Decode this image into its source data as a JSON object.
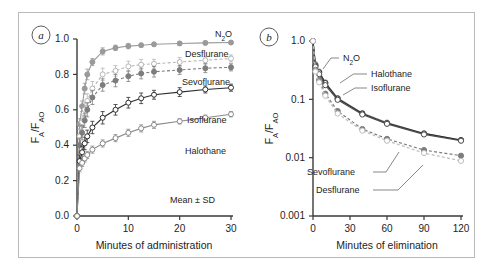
{
  "figure": {
    "background_color": "#ffffff",
    "frame_color": "#b9b9b9",
    "axis_color": "#3a3a3a"
  },
  "panels": [
    {
      "tag": "a",
      "xlabel": "Minutes of administration",
      "ylabel_main": "F",
      "ylabel_sub1": "A",
      "ylabel_slash": "/F",
      "ylabel_sub2": "AO",
      "annotation": "Mean ± SD",
      "xticks": [
        "0",
        "10",
        "20",
        "30"
      ],
      "yticks": [
        "0.0",
        "0.2",
        "0.4",
        "0.6",
        "0.8",
        "1.0"
      ],
      "series_labels": [
        "N2O",
        "Desflurane",
        "Sevoflurane",
        "Isoflurane",
        "Halothane"
      ]
    },
    {
      "tag": "b",
      "xlabel": "Minutes of elimination",
      "ylabel_main": "F",
      "ylabel_sub1": "A",
      "ylabel_slash": "/F",
      "ylabel_sub2": "AO",
      "xticks": [
        "0",
        "30",
        "60",
        "90",
        "120"
      ],
      "yticks": [
        "0.001",
        "0.01",
        "0.1",
        "1.0"
      ],
      "series_labels": [
        "N2O",
        "Halothane",
        "Isoflurane",
        "Sevoflurane",
        "Desflurane"
      ]
    }
  ],
  "chart_data": [
    {
      "type": "line",
      "panel": "a",
      "title": "Uptake of inhaled anesthetics",
      "xlabel": "Minutes of administration",
      "ylabel": "FA/FAO",
      "xlim": [
        0,
        30
      ],
      "ylim": [
        0.0,
        1.0
      ],
      "xticks": [
        0,
        10,
        20,
        30
      ],
      "yticks": [
        0.0,
        0.2,
        0.4,
        0.6,
        0.8,
        1.0
      ],
      "grid": false,
      "legend": "inline-right",
      "annotation": "Mean ± SD",
      "series": [
        {
          "name": "N2O",
          "label": "N₂O",
          "color": "#9a9a9a",
          "line_style": "solid",
          "marker": "filled-circle",
          "x": [
            0,
            0.5,
            1,
            1.5,
            2,
            3,
            5,
            7.5,
            10,
            12.5,
            15,
            20,
            25,
            30
          ],
          "y": [
            0.0,
            0.52,
            0.62,
            0.72,
            0.8,
            0.87,
            0.93,
            0.95,
            0.96,
            0.965,
            0.97,
            0.975,
            0.978,
            0.98
          ],
          "error": [
            0,
            0.03,
            0.03,
            0.03,
            0.03,
            0.02,
            0.02,
            0.015,
            0.015,
            0.01,
            0.01,
            0.01,
            0.01,
            0.01
          ]
        },
        {
          "name": "Desflurane",
          "label": "Desflurane",
          "color": "#b5b5b5",
          "line_style": "dashed",
          "marker": "open-circle",
          "x": [
            0,
            0.5,
            1,
            1.5,
            2,
            3,
            5,
            7.5,
            10,
            12.5,
            15,
            20,
            25,
            30
          ],
          "y": [
            0.0,
            0.45,
            0.53,
            0.6,
            0.65,
            0.72,
            0.8,
            0.82,
            0.845,
            0.855,
            0.86,
            0.87,
            0.88,
            0.89
          ],
          "error": [
            0,
            0.04,
            0.04,
            0.04,
            0.04,
            0.04,
            0.035,
            0.03,
            0.03,
            0.03,
            0.025,
            0.025,
            0.02,
            0.02
          ]
        },
        {
          "name": "Sevoflurane",
          "label": "Sevoflurane",
          "color": "#7d7d7d",
          "line_style": "dashed",
          "marker": "filled-circle",
          "x": [
            0,
            0.5,
            1,
            1.5,
            2,
            3,
            5,
            7.5,
            10,
            12.5,
            15,
            20,
            25,
            30
          ],
          "y": [
            0.0,
            0.4,
            0.47,
            0.54,
            0.6,
            0.67,
            0.74,
            0.765,
            0.79,
            0.805,
            0.815,
            0.825,
            0.835,
            0.84
          ],
          "error": [
            0,
            0.04,
            0.04,
            0.04,
            0.04,
            0.04,
            0.035,
            0.035,
            0.03,
            0.03,
            0.03,
            0.025,
            0.025,
            0.02
          ]
        },
        {
          "name": "Isoflurane",
          "label": "Isoflurane",
          "color": "#2e2e2e",
          "line_style": "solid",
          "marker": "open-circle",
          "x": [
            0,
            0.5,
            1,
            1.5,
            2,
            3,
            5,
            7.5,
            10,
            12.5,
            15,
            20,
            25,
            30
          ],
          "y": [
            0.0,
            0.31,
            0.36,
            0.41,
            0.45,
            0.5,
            0.555,
            0.6,
            0.64,
            0.665,
            0.685,
            0.7,
            0.715,
            0.725
          ],
          "error": [
            0,
            0.035,
            0.035,
            0.035,
            0.035,
            0.035,
            0.035,
            0.03,
            0.03,
            0.03,
            0.025,
            0.025,
            0.02,
            0.02
          ]
        },
        {
          "name": "Halothane",
          "label": "Halothane",
          "color": "#8a8a8a",
          "line_style": "solid",
          "marker": "open-circle",
          "x": [
            0,
            0.5,
            1,
            1.5,
            2,
            3,
            5,
            7.5,
            10,
            12.5,
            15,
            20,
            25,
            30
          ],
          "y": [
            0.0,
            0.27,
            0.3,
            0.325,
            0.345,
            0.375,
            0.41,
            0.44,
            0.47,
            0.495,
            0.515,
            0.535,
            0.555,
            0.575
          ],
          "error": [
            0,
            0.02,
            0.02,
            0.02,
            0.02,
            0.02,
            0.02,
            0.02,
            0.02,
            0.02,
            0.02,
            0.015,
            0.015,
            0.015
          ]
        }
      ]
    },
    {
      "type": "line",
      "panel": "b",
      "title": "Elimination of inhaled anesthetics",
      "xlabel": "Minutes of elimination",
      "ylabel": "FA/FAO",
      "xlim": [
        0,
        120
      ],
      "ylim": [
        0.001,
        1.0
      ],
      "yscale": "log",
      "xticks": [
        0,
        30,
        60,
        90,
        120
      ],
      "yticks": [
        0.001,
        0.01,
        0.1,
        1.0
      ],
      "grid": false,
      "legend": "inline-callout",
      "series": [
        {
          "name": "N2O",
          "label": "N₂O",
          "color": "#9a9a9a",
          "line_style": "solid",
          "marker": "filled-circle",
          "x": [
            0,
            2,
            5,
            10,
            20,
            40,
            60,
            90,
            120
          ],
          "y": [
            1.0,
            0.4,
            0.3,
            0.195,
            0.105,
            0.058,
            0.04,
            0.026,
            0.02
          ]
        },
        {
          "name": "Halothane",
          "label": "Halothane",
          "color": "#2e2e2e",
          "line_style": "solid",
          "marker": "open-circle",
          "x": [
            0,
            2,
            5,
            10,
            20,
            40,
            60,
            90,
            120
          ],
          "y": [
            1.0,
            0.38,
            0.29,
            0.19,
            0.103,
            0.057,
            0.039,
            0.026,
            0.02
          ]
        },
        {
          "name": "Isoflurane",
          "label": "Isoflurane",
          "color": "#4a4a4a",
          "line_style": "solid",
          "marker": "open-circle",
          "x": [
            0,
            2,
            5,
            10,
            20,
            40,
            60,
            90,
            120
          ],
          "y": [
            1.0,
            0.36,
            0.27,
            0.175,
            0.098,
            0.055,
            0.038,
            0.025,
            0.0195
          ]
        },
        {
          "name": "Sevoflurane",
          "label": "Sevoflurane",
          "color": "#7d7d7d",
          "line_style": "dashed",
          "marker": "filled-circle",
          "x": [
            0,
            2,
            5,
            10,
            20,
            40,
            60,
            90,
            120
          ],
          "y": [
            1.0,
            0.32,
            0.215,
            0.125,
            0.063,
            0.031,
            0.021,
            0.0135,
            0.0108
          ]
        },
        {
          "name": "Desflurane",
          "label": "Desflurane",
          "color": "#bdbdbd",
          "line_style": "dashed",
          "marker": "open-circle",
          "x": [
            0,
            2,
            5,
            10,
            20,
            40,
            60,
            90,
            120
          ],
          "y": [
            1.0,
            0.3,
            0.195,
            0.115,
            0.057,
            0.029,
            0.0195,
            0.012,
            0.0088
          ]
        }
      ]
    }
  ]
}
